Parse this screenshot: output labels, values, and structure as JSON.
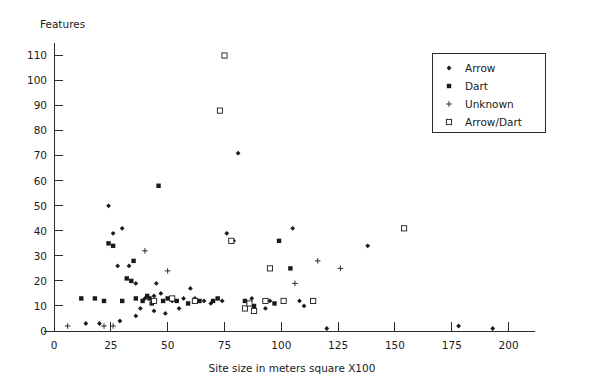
{
  "chart_data": {
    "type": "scatter",
    "title": "",
    "ylabel": "Features",
    "xlabel": "Site size in meters square X100",
    "xlim": [
      0,
      205
    ],
    "ylim": [
      0,
      113
    ],
    "xticks": [
      0,
      25,
      50,
      75,
      100,
      125,
      150,
      175,
      200
    ],
    "yticks": [
      0,
      10,
      20,
      30,
      40,
      50,
      60,
      70,
      80,
      90,
      100,
      110
    ],
    "grid": false,
    "legend_position": "top-right",
    "legend_entries": [
      {
        "label": "Arrow",
        "marker": "diamond"
      },
      {
        "label": "Dart",
        "marker": "filled-square"
      },
      {
        "label": "Unknown",
        "marker": "plus"
      },
      {
        "label": "Arrow/Dart",
        "marker": "open-square"
      }
    ],
    "series": [
      {
        "name": "Arrow",
        "marker": "diamond",
        "points": [
          [
            24,
            50
          ],
          [
            26,
            39
          ],
          [
            30,
            41
          ],
          [
            28,
            26
          ],
          [
            33,
            26
          ],
          [
            36,
            19
          ],
          [
            40,
            13
          ],
          [
            44,
            14
          ],
          [
            45,
            19
          ],
          [
            47,
            15
          ],
          [
            52,
            12
          ],
          [
            57,
            13
          ],
          [
            60,
            17
          ],
          [
            62,
            13
          ],
          [
            66,
            12
          ],
          [
            69,
            11
          ],
          [
            74,
            12
          ],
          [
            76,
            39
          ],
          [
            79,
            36
          ],
          [
            81,
            71
          ],
          [
            87,
            13
          ],
          [
            95,
            12
          ],
          [
            105,
            41
          ],
          [
            108,
            12
          ],
          [
            110,
            10
          ],
          [
            14,
            3
          ],
          [
            20,
            3
          ],
          [
            29,
            4
          ],
          [
            36,
            6
          ],
          [
            49,
            7
          ],
          [
            44,
            8
          ],
          [
            38,
            9
          ],
          [
            55,
            9
          ],
          [
            93,
            9
          ],
          [
            120,
            1
          ],
          [
            178,
            2
          ],
          [
            193,
            1
          ],
          [
            138,
            34
          ]
        ]
      },
      {
        "name": "Dart",
        "marker": "filled-square",
        "points": [
          [
            24,
            35
          ],
          [
            26,
            34
          ],
          [
            32,
            21
          ],
          [
            34,
            20
          ],
          [
            36,
            13
          ],
          [
            41,
            14
          ],
          [
            42,
            13
          ],
          [
            46,
            58
          ],
          [
            12,
            13
          ],
          [
            18,
            13
          ],
          [
            22,
            12
          ],
          [
            30,
            12
          ],
          [
            39,
            12
          ],
          [
            48,
            12
          ],
          [
            54,
            12
          ],
          [
            64,
            12
          ],
          [
            70,
            12
          ],
          [
            72,
            13
          ],
          [
            84,
            12
          ],
          [
            88,
            10
          ],
          [
            97,
            11
          ],
          [
            99,
            36
          ],
          [
            104,
            25
          ],
          [
            50,
            13
          ],
          [
            35,
            28
          ],
          [
            43,
            11
          ],
          [
            59,
            11
          ]
        ]
      },
      {
        "name": "Unknown",
        "marker": "plus",
        "points": [
          [
            40,
            32
          ],
          [
            6,
            2
          ],
          [
            22,
            2
          ],
          [
            26,
            2
          ],
          [
            50,
            24
          ],
          [
            116,
            28
          ],
          [
            106,
            19
          ],
          [
            126,
            25
          ]
        ]
      },
      {
        "name": "Arrow/Dart",
        "marker": "open-square",
        "points": [
          [
            75,
            110
          ],
          [
            73,
            88
          ],
          [
            52,
            13
          ],
          [
            62,
            12
          ],
          [
            78,
            36
          ],
          [
            84,
            9
          ],
          [
            86,
            11
          ],
          [
            88,
            8
          ],
          [
            93,
            12
          ],
          [
            101,
            12
          ],
          [
            95,
            25
          ],
          [
            154,
            41
          ],
          [
            114,
            12
          ],
          [
            44,
            12
          ]
        ]
      }
    ]
  }
}
